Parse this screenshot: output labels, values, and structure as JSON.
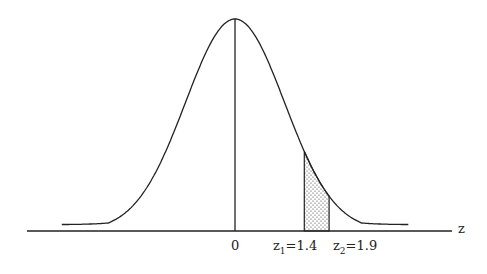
{
  "chart_data": {
    "type": "area",
    "title": "",
    "xlabel": "z",
    "ylabel": "",
    "distribution": "standard normal",
    "mean": 0,
    "center_label": "0",
    "shaded_region": {
      "from": 1.4,
      "to": 1.9,
      "pattern": "dotted"
    },
    "annotations": [
      {
        "text": "z1=1.4",
        "sym": "z",
        "sub": "1",
        "value": "=1.4",
        "x": 1.4
      },
      {
        "text": "z2=1.9",
        "sym": "z",
        "sub": "2",
        "value": "=1.9",
        "x": 1.9
      }
    ],
    "axis_label": "z",
    "xlim": [
      -3.5,
      3.5
    ],
    "grid": false,
    "legend": null
  },
  "labels": {
    "zero": "0",
    "axis": "z",
    "z1_sym": "z",
    "z1_sub": "1",
    "z1_val": "=1.4",
    "z2_sym": "z",
    "z2_sub": "2",
    "z2_val": "=1.9"
  }
}
